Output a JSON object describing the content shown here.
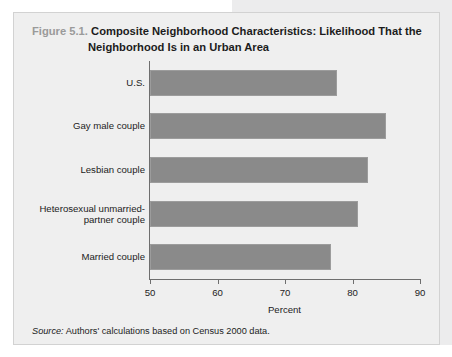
{
  "figure": {
    "number": "Figure 5.1.",
    "title_line1": "Composite Neighborhood Characteristics: Likelihood That the",
    "title_line2": "Neighborhood Is in an Urban Area",
    "source_label": "Source:",
    "source_text": " Authors' calculations based on Census 2000 data."
  },
  "colors": {
    "bar_fill": "#8a8a8a",
    "bar_stroke": "#9c9c9c",
    "panel_bg": "#efefef",
    "panel_border": "#d2d2d2",
    "axis": "#6e6e6e",
    "fignum_gray": "#9a9a9a",
    "text": "#1c1c1c"
  },
  "chart_data": {
    "type": "bar",
    "orientation": "horizontal",
    "title": "Composite Neighborhood Characteristics: Likelihood That the Neighborhood Is in an Urban Area",
    "xlabel": "Percent",
    "ylabel": "",
    "xlim": [
      50,
      90
    ],
    "xticks": [
      50,
      60,
      70,
      80,
      90
    ],
    "xtick_labels": [
      "50",
      "60",
      "70",
      "80",
      "90"
    ],
    "grid": false,
    "legend": false,
    "categories": [
      "U.S.",
      "Gay male couple",
      "Lesbian couple",
      "Heterosexual unmarried-partner couple",
      "Married couple"
    ],
    "category_labels": [
      [
        "U.S."
      ],
      [
        "Gay male couple"
      ],
      [
        "Lesbian couple"
      ],
      [
        "Heterosexual unmarried-",
        "partner couple"
      ],
      [
        "Married couple"
      ]
    ],
    "values": [
      77.7,
      85.0,
      82.3,
      80.8,
      76.8
    ],
    "units": "percent",
    "source": "Authors' calculations based on Census 2000 data."
  }
}
